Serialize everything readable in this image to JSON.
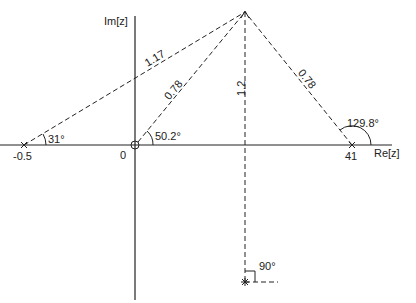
{
  "axes": {
    "real_label": "Re[z]",
    "imag_label": "Im[z]"
  },
  "points": {
    "left_pole_label": "-0.5",
    "origin_label": "0",
    "right_pole_label": "41"
  },
  "segments": {
    "left_to_apex": "1.17",
    "origin_to_apex": "0.78",
    "right_to_apex": "0.78",
    "vertical": "1.2"
  },
  "angles": {
    "left": "31°",
    "origin": "50.2°",
    "right": "129.8°",
    "bottom": "90°"
  },
  "colors": {
    "ink": "#222222",
    "background": "#ffffff"
  }
}
